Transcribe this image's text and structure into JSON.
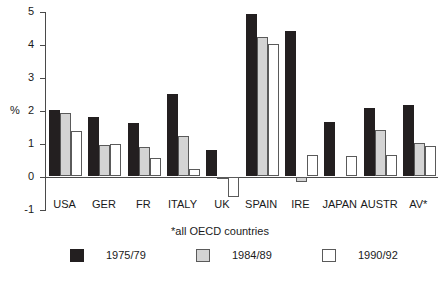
{
  "chart_data": {
    "type": "bar",
    "title": "",
    "xlabel": "",
    "ylabel": "%",
    "ylim": [
      -1,
      5
    ],
    "yticks": [
      5,
      4,
      3,
      2,
      1,
      0,
      -1
    ],
    "ytick_labels": [
      "5",
      "4",
      "3",
      "2",
      "1",
      "0",
      "-1"
    ],
    "grid": false,
    "legend_position": "bottom",
    "annotation": "*all OECD countries",
    "categories": [
      "USA",
      "GER",
      "FR",
      "ITALY",
      "UK",
      "SPAIN",
      "IRE",
      "JAPAN",
      "AUSTR",
      "AV*"
    ],
    "series": [
      {
        "name": "1975/79",
        "color": "#231f20",
        "values": [
          2.0,
          1.8,
          1.6,
          2.5,
          0.8,
          4.9,
          4.4,
          1.65,
          2.05,
          2.15
        ]
      },
      {
        "name": "1984/89",
        "color": "#d4d4d4",
        "values": [
          1.9,
          0.93,
          0.87,
          1.2,
          -0.05,
          4.2,
          -0.15,
          0,
          1.4,
          1.0
        ]
      },
      {
        "name": "1990/92",
        "color": "#ffffff",
        "values": [
          1.35,
          0.97,
          0.55,
          0.2,
          -0.6,
          4.0,
          0.65,
          0.6,
          0.65,
          0.9
        ]
      }
    ]
  },
  "axis": {
    "y_unit_label": "%"
  }
}
